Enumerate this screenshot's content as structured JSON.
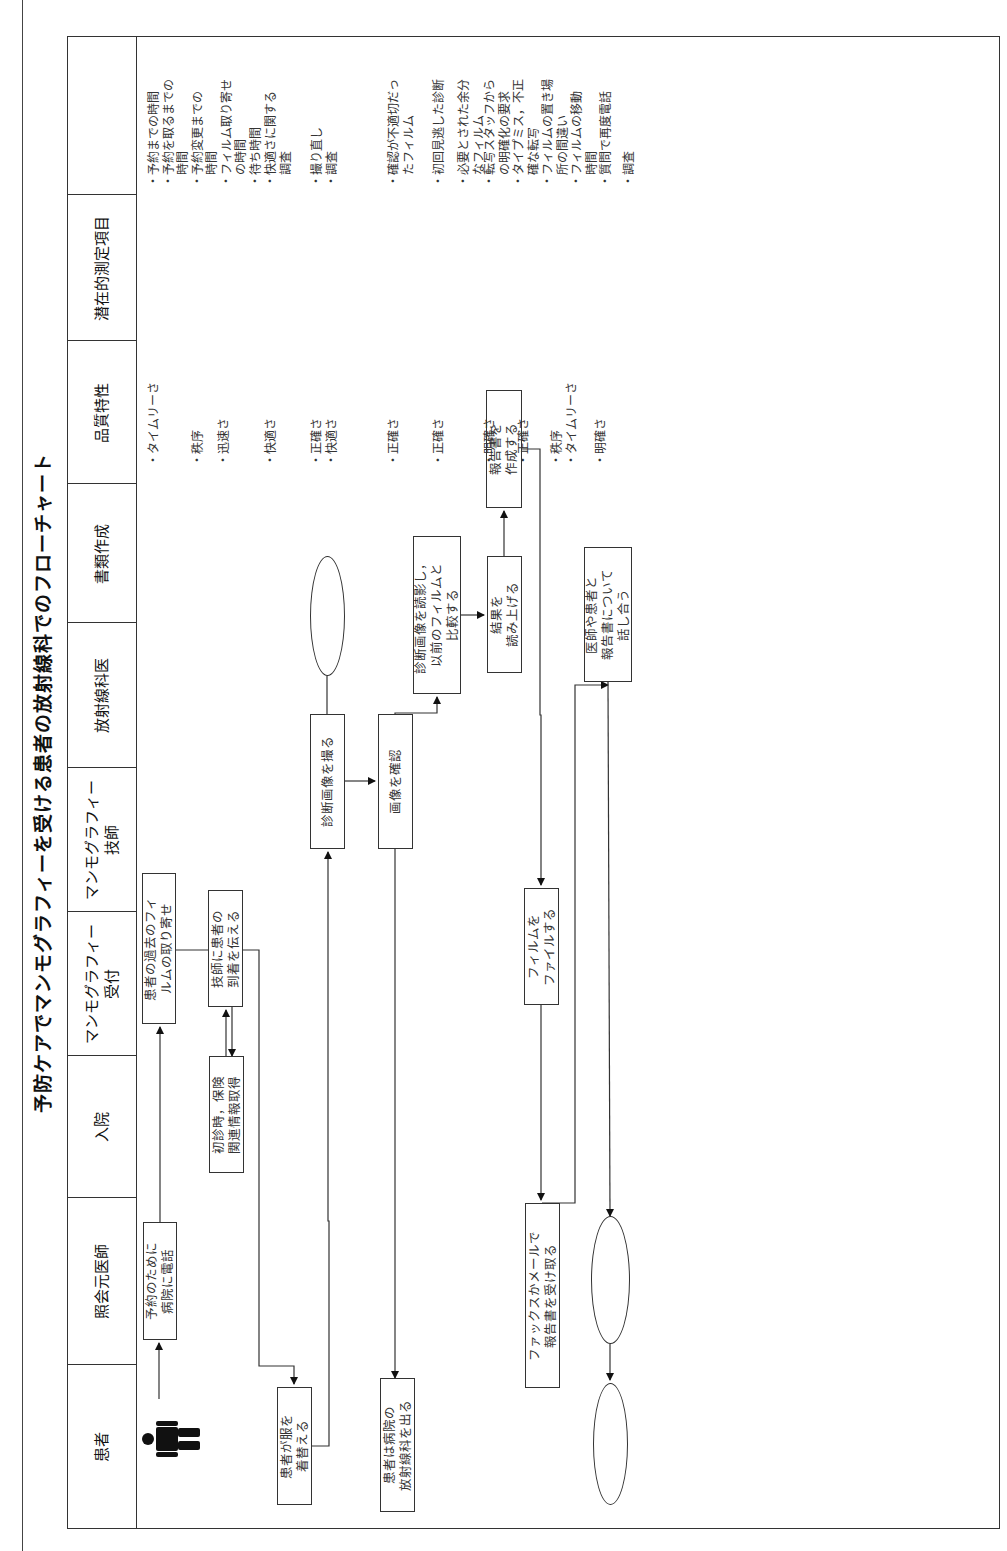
{
  "title": "予防ケアでマンモグラフィーを受ける患者の放射線科でのフローチャート",
  "columns": [
    {
      "label": "患者"
    },
    {
      "label": "照会元医師"
    },
    {
      "label": "入院"
    },
    {
      "label": "マンモグラフィー\n受付"
    },
    {
      "label": "マンモグラフィー\n技師"
    },
    {
      "label": "放射線科医"
    },
    {
      "label": "書類作成"
    },
    {
      "label": "品質特性"
    },
    {
      "label": "潜在的測定項目"
    }
  ],
  "flow": {
    "start_icon": "person-icon",
    "steps": [
      {
        "id": "call",
        "lane": "照会元医師",
        "text": "予約のために\n病院に電話"
      },
      {
        "id": "retrieve_films",
        "lane": "マンモグラフィー受付",
        "text": "患者の過去のフィ\nルムの取り寄せ"
      },
      {
        "id": "intake",
        "lane": "入院",
        "text": "初診時，保険\n関連情報取得"
      },
      {
        "id": "notify_tech",
        "lane": "マンモグラフィー受付",
        "text": "技師に患者の\n到着を伝える"
      },
      {
        "id": "change",
        "lane": "患者",
        "text": "患者が服を\n着替える"
      },
      {
        "id": "take_images",
        "lane": "マンモグラフィー技師",
        "text": "診断画像を撮る"
      },
      {
        "id": "check_images",
        "lane": "マンモグラフィー技師",
        "text": "画像を確認"
      },
      {
        "id": "leave",
        "lane": "患者",
        "text": "患者は病院の\n放射線科を出る"
      },
      {
        "id": "read_compare",
        "lane": "放射線科医",
        "text": "診断画像を読影し，\n以前のフィルムと\n比較する"
      },
      {
        "id": "dictate",
        "lane": "放射線科医",
        "text": "結果を\n読み上げる"
      },
      {
        "id": "write_report",
        "lane": "書類作成",
        "text": "報告書を\n作成する"
      },
      {
        "id": "file_films",
        "lane": "マンモグラフィー受付",
        "text": "フィルムを\nファイルする"
      },
      {
        "id": "receive_report",
        "lane": "照会元医師",
        "text": "ファックスかメールで\n報告書を受け取る"
      },
      {
        "id": "discuss",
        "lane": "放射線科医",
        "text": "医師や患者と\n報告書について\n話し合う"
      }
    ],
    "terminators": [
      {
        "id": "radiologist-oval",
        "lane": "放射線科医"
      },
      {
        "id": "referring-oval",
        "lane": "照会元医師"
      },
      {
        "id": "patient-end-oval",
        "lane": "患者"
      }
    ]
  },
  "quality_characteristics": [
    "・タイムリーさ",
    "・秩序",
    "・迅速さ",
    "・快適さ",
    "・正確さ\n・快適さ",
    "・正確さ",
    "・正確さ",
    "・明確さ",
    "・正確さ",
    "・秩序\n・タイムリーさ",
    "・明確さ"
  ],
  "potential_measures": [
    "・予約までの時間\n・予約を取るまでの\n　時間\n・予約変更までの\n　時間\n・フィルム取り寄せ\n　の時間\n・待ち時間",
    "・快適さに関する\n　調査",
    "・撮り直し\n・調査",
    "・確認が不適切だっ\n　たフィルム",
    "・初回見逃した診断",
    "・必要とされた余分\n　なフィルム",
    "・転写スタッフから\n　の明確化の要求\n・タイプミス，不正\n　確な転写\n・フィルムの置き場\n　所の間違い\n・フィルムの移動\n　時間\n・質問で再度電話",
    "・調査"
  ]
}
